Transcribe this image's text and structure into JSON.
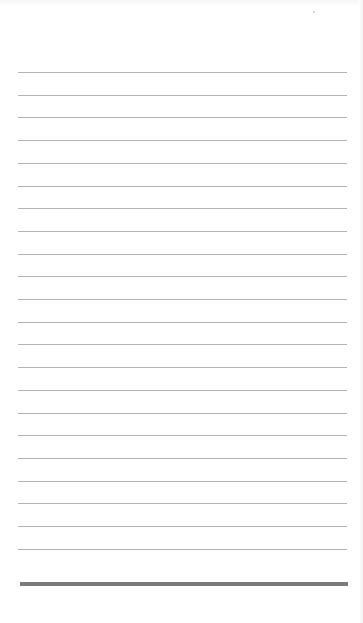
{
  "page": {
    "type": "lined-notepad",
    "background_color": "#ffffff",
    "rule_color": "#b4b4b4",
    "bottom_bar_color": "#7a7a7a",
    "rule_count": 22,
    "first_rule_y": 72,
    "rule_spacing": 22.7,
    "rule_left": 18,
    "rule_width": 329,
    "bottom_bar_y": 582,
    "text_lines": []
  }
}
